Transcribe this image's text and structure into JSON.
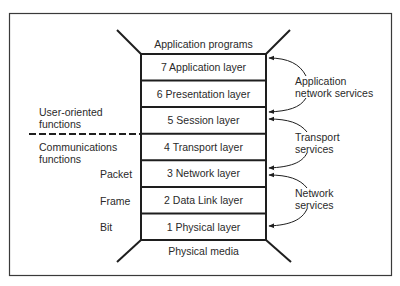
{
  "diagram": {
    "type": "osi-model-stack",
    "top_label": "Application programs",
    "bottom_label": "Physical media",
    "layers": [
      {
        "number": 7,
        "label": "7 Application layer"
      },
      {
        "number": 6,
        "label": "6 Presentation layer"
      },
      {
        "number": 5,
        "label": "5 Session layer"
      },
      {
        "number": 4,
        "label": "4 Transport layer"
      },
      {
        "number": 3,
        "label": "3 Network layer"
      },
      {
        "number": 2,
        "label": "2 Data Link layer"
      },
      {
        "number": 1,
        "label": "1 Physical layer"
      }
    ],
    "left_groups": {
      "upper": {
        "line1": "User-oriented",
        "line2": "functions"
      },
      "lower": {
        "line1": "Communications",
        "line2": "functions"
      }
    },
    "units": {
      "packet": "Packet",
      "frame": "Frame",
      "bit": "Bit"
    },
    "services": [
      {
        "line1": "Application",
        "line2": "network services"
      },
      {
        "line1": "Transport",
        "line2": "services"
      },
      {
        "line1": "Network",
        "line2": "services"
      }
    ],
    "colors": {
      "line": "#1e1e1e",
      "frame": "#3a3a3a",
      "text": "#2a2a2a",
      "background": "#ffffff"
    }
  }
}
